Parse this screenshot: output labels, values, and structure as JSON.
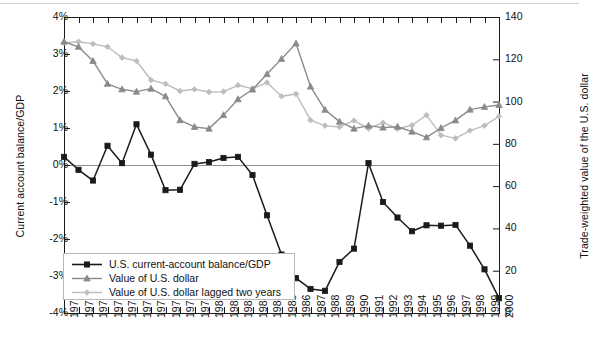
{
  "chart_data": {
    "type": "line",
    "title": "",
    "xlabel": "",
    "ylabel": "Current account balance/GDP",
    "ylabel_right": "Trade-weighted value of the U.S. dollar",
    "x": [
      1970,
      1971,
      1972,
      1973,
      1974,
      1975,
      1976,
      1977,
      1978,
      1979,
      1980,
      1981,
      1982,
      1983,
      1984,
      1985,
      1986,
      1987,
      1988,
      1989,
      1990,
      1991,
      1992,
      1993,
      1994,
      1995,
      1996,
      1997,
      1998,
      1999,
      2000
    ],
    "xtick_labels": [
      "1970",
      "1971",
      "1972",
      "1973",
      "1974",
      "1975",
      "1976",
      "1977",
      "1978",
      "1979",
      "1980",
      "1981",
      "1982",
      "1983",
      "1984",
      "1985",
      "1986",
      "1987",
      "1988",
      "1989",
      "1990",
      "1991",
      "1992",
      "1993",
      "1994",
      "1995",
      "1996",
      "1997",
      "1998",
      "1999",
      "2000"
    ],
    "ylim": [
      -4,
      4
    ],
    "ytick_labels": [
      "4%",
      "3%",
      "2%",
      "1%",
      "0%",
      "-1%",
      "-2%",
      "-3%",
      "-4%"
    ],
    "ytick_values": [
      4,
      3,
      2,
      1,
      0,
      -1,
      -2,
      -3,
      -4
    ],
    "ylim_right": [
      0,
      140
    ],
    "ytick_labels_right": [
      "140",
      "120",
      "100",
      "80",
      "60",
      "40",
      "20",
      "0"
    ],
    "ytick_values_right": [
      140,
      120,
      100,
      80,
      60,
      40,
      20,
      0
    ],
    "grid": false,
    "legend_position": "inside-lower-left",
    "zero_line": true,
    "series": [
      {
        "name": "U.S. current-account balance/GDP",
        "axis": "left",
        "color": "#1a1a1a",
        "marker": "square",
        "values": [
          0.22,
          -0.13,
          -0.42,
          0.52,
          0.05,
          1.1,
          0.28,
          -0.68,
          -0.67,
          0.03,
          0.08,
          0.19,
          0.22,
          -0.27,
          -1.36,
          -2.42,
          -3.06,
          -3.35,
          -3.4,
          -2.62,
          -2.26,
          0.05,
          -1.0,
          -1.42,
          -1.79,
          -1.63,
          -1.64,
          -1.62,
          -2.18,
          -2.82,
          -3.6
        ]
      },
      {
        "name": "Value of U.S. dollar",
        "axis": "right",
        "color": "#8a8a8a",
        "marker": "triangle",
        "values": [
          128.3,
          125.9,
          119.2,
          108.4,
          105.8,
          104.7,
          106.1,
          102.5,
          91.2,
          88.0,
          87.2,
          93.6,
          101.1,
          105.7,
          113.0,
          120.2,
          127.5,
          107.1,
          96.1,
          90.5,
          87.2,
          88.6,
          87.7,
          88.1,
          85.8,
          83.1,
          87.5,
          91.1,
          96.2,
          97.5,
          98.4
        ]
      },
      {
        "name": "Value of U.S. dollar lagged two years",
        "axis": "right",
        "color": "#bdbdbd",
        "marker": "diamond",
        "values": [
          127.9,
          128.3,
          127.3,
          125.9,
          120.8,
          119.2,
          110.2,
          108.4,
          105.0,
          105.8,
          104.5,
          104.7,
          107.7,
          106.1,
          109.0,
          102.5,
          103.6,
          91.2,
          88.6,
          88.0,
          91.0,
          87.2,
          90.0,
          87.2,
          88.8,
          93.6,
          84.1,
          82.6,
          86.3,
          88.6,
          93.0
        ]
      }
    ]
  },
  "legend": {
    "items": [
      {
        "label": "U.S. current-account balance/GDP",
        "marker": "square",
        "color": "#1a1a1a"
      },
      {
        "label": "Value of U.S. dollar",
        "marker": "triangle",
        "color": "#8a8a8a"
      },
      {
        "label": "Value of U.S. dollar lagged two years",
        "marker": "diamond",
        "color": "#bdbdbd"
      }
    ]
  }
}
